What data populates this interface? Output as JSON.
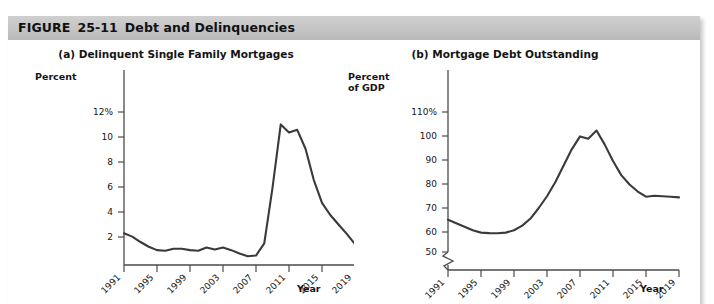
{
  "figure": {
    "label": "FIGURE",
    "number": "25-11",
    "title": "Debt and Delinquencies"
  },
  "panels": [
    {
      "id": "a",
      "title": "(a) Delinquent Single Family Mortgages",
      "y_axis_label": "Percent",
      "x_axis_label": "Year",
      "y_ticks": [
        "12%",
        "10",
        "8",
        "6",
        "4",
        "2"
      ],
      "x_ticks": [
        "1991",
        "1995",
        "1999",
        "2003",
        "2007",
        "2011",
        "2015",
        "2019"
      ],
      "axis_break": false
    },
    {
      "id": "b",
      "title": "(b) Mortgage Debt Outstanding",
      "y_axis_label_line1": "Percent",
      "y_axis_label_line2": "of GDP",
      "x_axis_label": "Year",
      "y_ticks": [
        "110%",
        "100",
        "90",
        "80",
        "70",
        "60",
        "50"
      ],
      "x_ticks": [
        "1991",
        "1995",
        "1999",
        "2003",
        "2007",
        "2011",
        "2015",
        "2019"
      ],
      "axis_break": true
    }
  ],
  "colors": {
    "header_bar": "#c4c4c4",
    "line": "#3a3a3a",
    "axis": "#4a4a4a",
    "text": "#141414",
    "page": "#ffffff"
  },
  "chart_data": [
    {
      "type": "line",
      "panel": "a",
      "title": "(a) Delinquent Single Family Mortgages",
      "xlabel": "Year",
      "ylabel": "Percent",
      "xlim": [
        1991,
        2019
      ],
      "ylim": [
        1.0,
        12.8
      ],
      "yticks": [
        2,
        4,
        6,
        8,
        10,
        12
      ],
      "ytick_labels": [
        "2",
        "4",
        "6",
        "8",
        "10",
        "12%"
      ],
      "xticks": [
        1991,
        1995,
        1999,
        2003,
        2007,
        2011,
        2015,
        2019
      ],
      "grid": false,
      "legend": "none",
      "series": [
        {
          "name": "Delinquency rate",
          "x": [
            1991,
            1992,
            1993,
            1994,
            1995,
            1996,
            1997,
            1998,
            1999,
            2000,
            2001,
            2002,
            2003,
            2004,
            2005,
            2006,
            2007,
            2008,
            2009,
            2010,
            2011,
            2012,
            2013,
            2014,
            2015,
            2016,
            2017,
            2018,
            2019
          ],
          "values": [
            3.35,
            3.1,
            2.7,
            2.35,
            2.1,
            2.05,
            2.2,
            2.2,
            2.1,
            2.05,
            2.3,
            2.15,
            2.3,
            2.1,
            1.85,
            1.65,
            1.7,
            2.6,
            6.7,
            11.4,
            10.8,
            11.0,
            9.6,
            7.3,
            5.6,
            4.7,
            4.0,
            3.3,
            2.55
          ]
        }
      ]
    },
    {
      "type": "line",
      "panel": "b",
      "title": "(b) Mortgage Debt Outstanding",
      "xlabel": "Year",
      "ylabel": "Percent of GDP",
      "xlim": [
        1991,
        2019
      ],
      "ylim": [
        47,
        114
      ],
      "yticks": [
        50,
        60,
        70,
        80,
        90,
        100,
        110
      ],
      "ytick_labels": [
        "50",
        "60",
        "70",
        "80",
        "90",
        "100",
        "110%"
      ],
      "xticks": [
        1991,
        1995,
        1999,
        2003,
        2007,
        2011,
        2015,
        2019
      ],
      "grid": false,
      "legend": "none",
      "axis_break_below": 50,
      "series": [
        {
          "name": "Mortgage debt outstanding",
          "x": [
            1991,
            1992,
            1993,
            1994,
            1995,
            1996,
            1997,
            1998,
            1999,
            2000,
            2001,
            2002,
            2003,
            2004,
            2005,
            2006,
            2007,
            2008,
            2009,
            2010,
            2011,
            2012,
            2013,
            2014,
            2015,
            2016,
            2017,
            2018,
            2019
          ],
          "values": [
            64.0,
            62.5,
            61.0,
            59.5,
            58.5,
            58.3,
            58.2,
            58.5,
            59.5,
            61.5,
            64.5,
            69.0,
            74.0,
            80.0,
            87.0,
            94.0,
            99.5,
            98.5,
            102.0,
            96.0,
            89.0,
            83.0,
            79.0,
            76.0,
            73.8,
            74.2,
            74.0,
            73.8,
            73.5
          ]
        }
      ]
    }
  ]
}
